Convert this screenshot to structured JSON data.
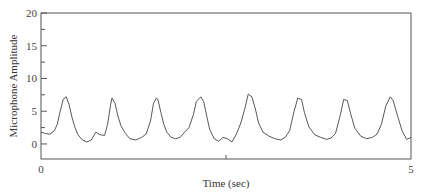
{
  "chart_data": {
    "type": "line",
    "title": "",
    "xlabel": "Time (sec)",
    "ylabel": "Microphone Amplitude",
    "xlim": [
      0,
      5
    ],
    "ylim": [
      -2.3,
      20
    ],
    "x_ticks": [
      0,
      5
    ],
    "x_minor_ticks": [
      2.5
    ],
    "y_ticks": [
      0,
      5,
      10,
      15,
      20
    ],
    "y_minor_ticks": [
      2.5,
      7.5,
      12.5,
      17.5
    ],
    "grid": false,
    "legend": null,
    "series": [
      {
        "name": "microphone signal",
        "color": "#444444",
        "x": [
          0.0,
          0.06,
          0.12,
          0.18,
          0.22,
          0.26,
          0.3,
          0.34,
          0.38,
          0.42,
          0.46,
          0.5,
          0.56,
          0.62,
          0.68,
          0.74,
          0.8,
          0.86,
          0.9,
          0.94,
          0.96,
          1.0,
          1.04,
          1.08,
          1.14,
          1.2,
          1.28,
          1.36,
          1.42,
          1.48,
          1.52,
          1.56,
          1.58,
          1.62,
          1.66,
          1.7,
          1.76,
          1.82,
          1.88,
          1.94,
          2.0,
          2.06,
          2.1,
          2.16,
          2.2,
          2.24,
          2.28,
          2.34,
          2.4,
          2.46,
          2.52,
          2.58,
          2.64,
          2.7,
          2.76,
          2.8,
          2.85,
          2.9,
          2.94,
          3.0,
          3.08,
          3.16,
          3.24,
          3.3,
          3.36,
          3.42,
          3.47,
          3.52,
          3.56,
          3.62,
          3.7,
          3.78,
          3.86,
          3.92,
          3.98,
          4.04,
          4.09,
          4.14,
          4.18,
          4.24,
          4.32,
          4.4,
          4.48,
          4.54,
          4.6,
          4.66,
          4.72,
          4.76,
          4.82,
          4.88,
          4.94,
          5.0
        ],
        "y": [
          1.8,
          1.6,
          1.5,
          2.0,
          3.0,
          5.0,
          6.8,
          7.2,
          6.0,
          4.0,
          2.5,
          1.4,
          0.6,
          0.3,
          0.6,
          1.8,
          1.4,
          1.3,
          3.0,
          6.0,
          7.0,
          6.2,
          4.2,
          2.8,
          1.6,
          0.8,
          0.6,
          1.0,
          1.5,
          3.5,
          6.2,
          7.0,
          6.8,
          4.8,
          3.0,
          1.8,
          1.0,
          0.8,
          1.0,
          1.8,
          2.5,
          4.5,
          6.5,
          7.2,
          6.4,
          4.2,
          2.2,
          0.8,
          0.4,
          1.0,
          0.8,
          0.3,
          1.5,
          3.2,
          5.6,
          7.6,
          7.2,
          5.2,
          3.2,
          1.8,
          1.2,
          0.8,
          0.6,
          1.0,
          2.0,
          5.0,
          7.0,
          6.8,
          4.8,
          2.6,
          1.4,
          1.0,
          0.7,
          0.9,
          1.6,
          4.2,
          6.8,
          6.6,
          4.8,
          2.4,
          1.2,
          0.8,
          1.0,
          1.5,
          3.0,
          5.8,
          7.2,
          6.6,
          4.2,
          2.0,
          0.7,
          1.0
        ]
      }
    ]
  },
  "labels": {
    "xlabel": "Time (sec)",
    "ylabel": "Microphone Amplitude",
    "x_tick_labels": [
      "0",
      "5"
    ],
    "y_tick_labels": [
      "0",
      "5",
      "10",
      "15",
      "20"
    ]
  }
}
